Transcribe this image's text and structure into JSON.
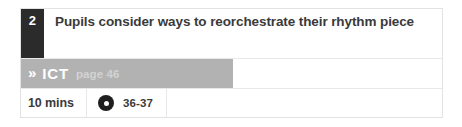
{
  "card": {
    "step_number": "2",
    "objective": "Pupils consider ways to reorchestrate their rhythm piece",
    "subject": {
      "icon": "double-chevron-icon",
      "label": "ICT",
      "page_reference": "page 46"
    },
    "meta": {
      "duration": "10 mins",
      "media_icon": "disc-icon",
      "track_range": "36-37"
    }
  },
  "icons": {
    "double_chevron_glyph": "»"
  },
  "colors": {
    "step_box": "#2b2b2b",
    "subject_band": "#b2b2b2",
    "text": "#3a3a3a",
    "page_ref": "#d2d2d2",
    "border": "#e8e8e8",
    "background": "#ffffff"
  }
}
